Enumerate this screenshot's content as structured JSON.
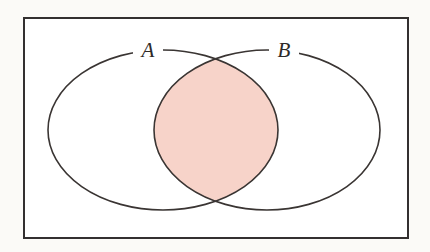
{
  "figure": {
    "kind": "venn-diagram",
    "background_color": "#fbfaf7",
    "universe": {
      "label": "",
      "fill_color": "#ffffff",
      "border_color": "#333030",
      "border_width": 2,
      "x": 24,
      "y": 18,
      "width": 384,
      "height": 220
    },
    "sets": [
      {
        "id": "A",
        "label": "A",
        "label_x": 148,
        "label_y": 57,
        "center_x": 163,
        "center_y": 130,
        "radius_x": 115,
        "radius_y": 80,
        "stroke_color": "#3a3533",
        "stroke_width": 1.6,
        "fill_color": "none"
      },
      {
        "id": "B",
        "label": "B",
        "label_x": 284,
        "label_y": 57,
        "center_x": 267,
        "center_y": 130,
        "radius_x": 113,
        "radius_y": 80,
        "stroke_color": "#3a3533",
        "stroke_width": 1.6,
        "fill_color": "none"
      }
    ],
    "shaded_region": {
      "name": "A-intersect-B",
      "notation": "A ∩ B",
      "fill_color": "#f7d3c9",
      "stroke_color": "#3a3533",
      "left_x": 154,
      "right_x": 278,
      "top_crossing_x": 215,
      "top_crossing_y": 84,
      "bottom_crossing_x": 215,
      "bottom_crossing_y": 185
    },
    "label_gaps": [
      {
        "set": "A",
        "gap_start_x": 133,
        "gap_end_x": 163
      },
      {
        "set": "B",
        "gap_start_x": 269,
        "gap_end_x": 299
      }
    ]
  }
}
